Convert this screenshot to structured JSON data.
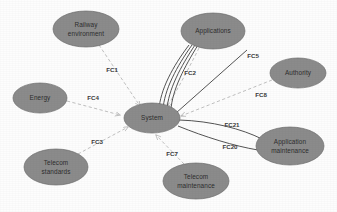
{
  "diagram": {
    "background_color": "#fdfdfd",
    "node_fill_color": "#8b8b8b",
    "dashed_edge_color": "#b9b9b9",
    "solid_edge_color": "#545454",
    "center_node": {
      "id": "system",
      "label": "System",
      "cx": 152,
      "cy": 118,
      "rx": 28,
      "ry": 15
    },
    "nodes": [
      {
        "id": "railway-environment",
        "label_line1": "Railway",
        "label_line2": "environment",
        "cx": 86,
        "cy": 29,
        "rx": 33,
        "ry": 18
      },
      {
        "id": "applications",
        "label_line1": "Applications",
        "label_line2": "",
        "cx": 213,
        "cy": 31,
        "rx": 32,
        "ry": 18
      },
      {
        "id": "authority",
        "label_line1": "Authority",
        "label_line2": "",
        "cx": 298,
        "cy": 73,
        "rx": 28,
        "ry": 15
      },
      {
        "id": "energy",
        "label_line1": "Energy",
        "label_line2": "",
        "cx": 40,
        "cy": 98,
        "rx": 27,
        "ry": 15
      },
      {
        "id": "telecom-standards",
        "label_line1": "Telecom",
        "label_line2": "standards",
        "cx": 56,
        "cy": 167,
        "rx": 32,
        "ry": 18
      },
      {
        "id": "telecom-maintenance",
        "label_line1": "Telecom",
        "label_line2": "maintenance",
        "cx": 196,
        "cy": 181,
        "rx": 33,
        "ry": 18
      },
      {
        "id": "application-maintenance",
        "label_line1": "Application",
        "label_line2": "maintenance",
        "cx": 290,
        "cy": 146,
        "rx": 34,
        "ry": 19
      }
    ],
    "edges": [
      {
        "id": "fc1",
        "label": "FC1",
        "from": "railway-environment",
        "to": "system",
        "style": "dashed",
        "label_x": 112,
        "label_y": 70
      },
      {
        "id": "fc2",
        "label": "FC2",
        "from": "applications",
        "to": "system",
        "style": "solid-bundle",
        "label_x": 190,
        "label_y": 73
      },
      {
        "id": "fc3",
        "label": "FC3",
        "from": "telecom-standards",
        "to": "system",
        "style": "dashed",
        "label_x": 97,
        "label_y": 142
      },
      {
        "id": "fc4",
        "label": "FC4",
        "from": "energy",
        "to": "system",
        "style": "dashed",
        "label_x": 93,
        "label_y": 98
      },
      {
        "id": "fc5",
        "label": "FC5",
        "from": "system",
        "to": "upper-right",
        "style": "solid",
        "label_x": 253,
        "label_y": 56
      },
      {
        "id": "fc7",
        "label": "FC7",
        "from": "telecom-maintenance",
        "to": "system",
        "style": "dashed",
        "label_x": 172,
        "label_y": 154
      },
      {
        "id": "fc8",
        "label": "FC8",
        "from": "authority",
        "to": "system",
        "style": "dashed",
        "label_x": 261,
        "label_y": 95
      },
      {
        "id": "fc20",
        "label": "FC20",
        "from": "system",
        "to": "application-maintenance",
        "style": "solid",
        "label_x": 230,
        "label_y": 147
      },
      {
        "id": "fc21",
        "label": "FC21",
        "from": "system",
        "to": "application-maintenance",
        "style": "solid",
        "label_x": 232,
        "label_y": 125
      }
    ]
  }
}
